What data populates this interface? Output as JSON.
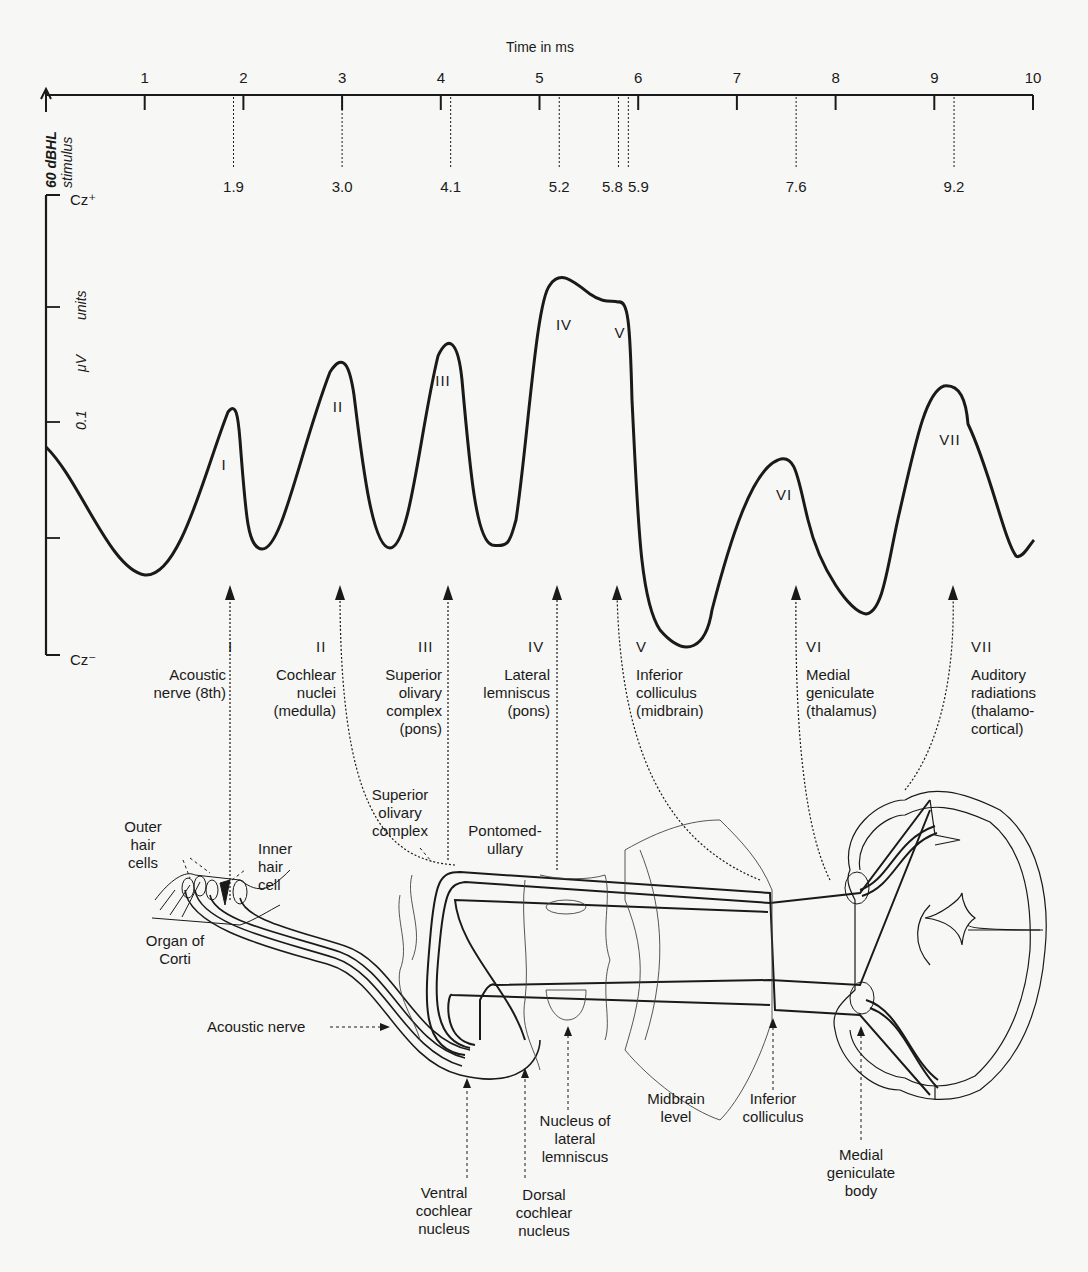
{
  "axis": {
    "title": "Time in ms",
    "ticks": [
      "1",
      "2",
      "3",
      "4",
      "5",
      "6",
      "7",
      "8",
      "9",
      "10"
    ],
    "stimulus_label_line1": "60 dBHL",
    "stimulus_label_line2": "stimulus",
    "y_top_label": "Cz⁺",
    "y_bottom_label": "Cz⁻",
    "y_unit_value": "0.1",
    "y_unit_mu": "μV",
    "y_unit_word": "units"
  },
  "latency_markers": [
    "1.9",
    "3.0",
    "4.1",
    "5.2",
    "5.8",
    "5.9",
    "7.6",
    "9.2"
  ],
  "wave_peak_labels": [
    "I",
    "II",
    "III",
    "IV",
    "V",
    "VI",
    "VII"
  ],
  "generators": [
    {
      "numeral": "I",
      "text": "Acoustic\nnerve (8th)"
    },
    {
      "numeral": "II",
      "text": "Cochlear\nnuclei\n(medulla)"
    },
    {
      "numeral": "III",
      "text": "Superior\nolivary\ncomplex\n(pons)"
    },
    {
      "numeral": "IV",
      "text": "Lateral\nlemniscus\n(pons)"
    },
    {
      "numeral": "V",
      "text": "Inferior\ncolliculus\n(midbrain)"
    },
    {
      "numeral": "VI",
      "text": "Medial\ngeniculate\n(thalamus)"
    },
    {
      "numeral": "VII",
      "text": "Auditory\nradiations\n(thalamo-\ncortical)"
    }
  ],
  "anatomy_labels": {
    "outer_hair_cells": "Outer\nhair\ncells",
    "inner_hair_cell": "Inner\nhair\ncell",
    "organ_of_corti": "Organ of\nCorti",
    "superior_olivary_complex": "Superior\nolivary\ncomplex",
    "pontomedullary": "Pontomed-\nullary",
    "acoustic_nerve": "Acoustic nerve",
    "ventral_cochlear_nucleus": "Ventral\ncochlear\nnucleus",
    "dorsal_cochlear_nucleus": "Dorsal\ncochlear\nnucleus",
    "nucleus_lateral_lemniscus": "Nucleus of\nlateral\nlemniscus",
    "midbrain_level": "Midbrain\nlevel",
    "inferior_colliculus": "Inferior\ncolliculus",
    "medial_geniculate_body": "Medial\ngeniculate\nbody"
  },
  "chart_data": {
    "type": "line",
    "xlabel": "Time in ms",
    "ylabel": "0.1 μV units",
    "xlim": [
      0,
      10
    ],
    "x_ticks": [
      1,
      2,
      3,
      4,
      5,
      6,
      7,
      8,
      9,
      10
    ],
    "y_range_labels": [
      "Cz⁻",
      "Cz⁺"
    ],
    "stimulus": "60 dBHL stimulus at t=0",
    "peak_latencies_ms": [
      {
        "wave": "I",
        "latency": 1.9,
        "generator": "Acoustic nerve (8th)"
      },
      {
        "wave": "II",
        "latency": 3.0,
        "generator": "Cochlear nuclei (medulla)"
      },
      {
        "wave": "III",
        "latency": 4.1,
        "generator": "Superior olivary complex (pons)"
      },
      {
        "wave": "IV",
        "latency": 5.2,
        "generator": "Lateral lemniscus (pons)"
      },
      {
        "wave": "V",
        "latency": 5.8,
        "generator": "Inferior colliculus (midbrain)"
      },
      {
        "wave": "VI",
        "latency": 7.6,
        "generator": "Medial geniculate (thalamus)"
      },
      {
        "wave": "VII",
        "latency": 9.2,
        "generator": "Auditory radiations (thalamo-cortical)"
      }
    ],
    "extra_marker_ms": 5.9,
    "waveform_approx": {
      "x_ms": [
        0,
        1.0,
        1.9,
        2.2,
        3.0,
        3.4,
        4.1,
        4.5,
        5.2,
        5.8,
        6.0,
        6.6,
        7.6,
        8.3,
        9.2,
        9.8,
        10.0
      ],
      "y_rel": [
        0.45,
        0.08,
        0.68,
        0.18,
        0.85,
        0.18,
        0.9,
        0.22,
        1.0,
        0.97,
        0.9,
        0.0,
        0.55,
        0.1,
        0.78,
        0.18,
        0.2
      ]
    }
  }
}
